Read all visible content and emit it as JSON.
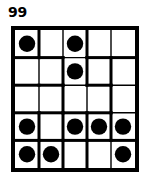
{
  "figure": {
    "label": "99",
    "type": "puzzle-grid"
  },
  "grid": {
    "rows": 5,
    "cols": 5,
    "cell_width": 25.0,
    "cell_height": 28.6,
    "outer_border_px": 4,
    "region_border_px": 3,
    "cell_border_px": 1.4,
    "line_color": "#000000",
    "cell_fill": "#ffffff",
    "dot_color": "#000000",
    "dot_radius": 8.2,
    "dots": [
      {
        "row": 1,
        "col": 1
      },
      {
        "row": 1,
        "col": 3
      },
      {
        "row": 2,
        "col": 3
      },
      {
        "row": 4,
        "col": 1
      },
      {
        "row": 4,
        "col": 3
      },
      {
        "row": 4,
        "col": 4
      },
      {
        "row": 4,
        "col": 5
      },
      {
        "row": 5,
        "col": 1
      },
      {
        "row": 5,
        "col": 2
      },
      {
        "row": 5,
        "col": 5
      }
    ],
    "thick_horizontal_segments": [
      {
        "row_line": 1,
        "col": 1
      },
      {
        "row_line": 1,
        "col": 2
      },
      {
        "row_line": 1,
        "col": 4
      },
      {
        "row_line": 1,
        "col": 5
      },
      {
        "row_line": 2,
        "col": 1
      },
      {
        "row_line": 2,
        "col": 2
      },
      {
        "row_line": 2,
        "col": 4
      },
      {
        "row_line": 3,
        "col": 1
      },
      {
        "row_line": 3,
        "col": 2
      },
      {
        "row_line": 3,
        "col": 3
      },
      {
        "row_line": 3,
        "col": 4
      },
      {
        "row_line": 4,
        "col": 1
      },
      {
        "row_line": 4,
        "col": 2
      },
      {
        "row_line": 4,
        "col": 3
      },
      {
        "row_line": 4,
        "col": 4
      },
      {
        "row_line": 4,
        "col": 5
      }
    ],
    "thick_vertical_segments": [
      {
        "col_line": 1,
        "row": 1
      },
      {
        "col_line": 1,
        "row": 4
      },
      {
        "col_line": 1,
        "row": 5
      },
      {
        "col_line": 2,
        "row": 2
      },
      {
        "col_line": 2,
        "row": 3
      },
      {
        "col_line": 2,
        "row": 4
      },
      {
        "col_line": 2,
        "row": 5
      },
      {
        "col_line": 3,
        "row": 1
      },
      {
        "col_line": 3,
        "row": 2
      },
      {
        "col_line": 3,
        "row": 4
      },
      {
        "col_line": 3,
        "row": 5
      },
      {
        "col_line": 4,
        "row": 2
      },
      {
        "col_line": 4,
        "row": 3
      },
      {
        "col_line": 4,
        "row": 4
      }
    ]
  }
}
